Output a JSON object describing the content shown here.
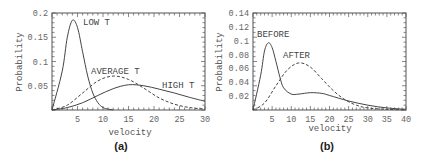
{
  "chart_data": [
    {
      "type": "line",
      "caption": "(a)",
      "xlabel": "velocity",
      "ylabel": "Probability",
      "xlim": [
        0,
        30
      ],
      "ylim": [
        0,
        0.2
      ],
      "xticks": [
        "5",
        "10",
        "15",
        "20",
        "25",
        "30"
      ],
      "yticks": [
        "0.05",
        "0.1",
        "0.15",
        "0.2"
      ],
      "grid": false,
      "series": [
        {
          "name": "LOW T",
          "style": "solid",
          "x": [
            0,
            2,
            3,
            4,
            5,
            6,
            7,
            8,
            9,
            10,
            11,
            12
          ],
          "y": [
            0,
            0.08,
            0.15,
            0.185,
            0.17,
            0.12,
            0.07,
            0.035,
            0.015,
            0.005,
            0.002,
            0
          ]
        },
        {
          "name": "AVERAGE T",
          "style": "dashed",
          "x": [
            0,
            3,
            6,
            9,
            12,
            15,
            18,
            21,
            24,
            27,
            30
          ],
          "y": [
            0,
            0.01,
            0.035,
            0.06,
            0.07,
            0.063,
            0.045,
            0.025,
            0.012,
            0.005,
            0.002
          ]
        },
        {
          "name": "HIGH T",
          "style": "solid",
          "x": [
            0,
            3,
            6,
            9,
            12,
            15,
            18,
            21,
            24,
            27,
            30
          ],
          "y": [
            0,
            0.005,
            0.015,
            0.03,
            0.044,
            0.052,
            0.05,
            0.043,
            0.035,
            0.026,
            0.018
          ]
        }
      ],
      "annotations": [
        "LOW T",
        "AVERAGE T",
        "HIGH T"
      ]
    },
    {
      "type": "line",
      "caption": "(b)",
      "xlabel": "velocity",
      "ylabel": "Probability",
      "xlim": [
        0,
        40
      ],
      "ylim": [
        0,
        0.14
      ],
      "xticks": [
        "5",
        "10",
        "15",
        "20",
        "25",
        "30",
        "35",
        "40"
      ],
      "yticks": [
        "0.02",
        "0.04",
        "0.06",
        "0.08",
        "0.1",
        "0.12",
        "0.14"
      ],
      "grid": false,
      "series": [
        {
          "name": "BEFORE",
          "style": "solid",
          "x": [
            0,
            2,
            3,
            4,
            5,
            6,
            7,
            8,
            10,
            12,
            15,
            18,
            20,
            25,
            30,
            35,
            40
          ],
          "y": [
            0,
            0.05,
            0.085,
            0.097,
            0.09,
            0.07,
            0.048,
            0.032,
            0.023,
            0.023,
            0.025,
            0.024,
            0.021,
            0.013,
            0.007,
            0.003,
            0.001
          ]
        },
        {
          "name": "AFTER",
          "style": "dashed",
          "x": [
            0,
            3,
            6,
            9,
            12,
            15,
            18,
            21,
            24,
            27,
            30,
            35,
            40
          ],
          "y": [
            0,
            0.01,
            0.035,
            0.058,
            0.068,
            0.062,
            0.045,
            0.028,
            0.015,
            0.007,
            0.003,
            0.001,
            0
          ]
        }
      ],
      "annotations": [
        "BEFORE",
        "AFTER"
      ]
    }
  ],
  "labels": {
    "a": {
      "caption": "(a)",
      "xlabel": "velocity",
      "ylabel": "Probability",
      "low": "LOW T",
      "avg": "AVERAGE T",
      "high": "HIGH T"
    },
    "b": {
      "caption": "(b)",
      "xlabel": "velocity",
      "ylabel": "Probability",
      "before": "BEFORE",
      "after": "AFTER"
    }
  }
}
